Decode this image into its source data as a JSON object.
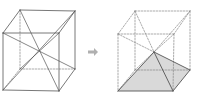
{
  "diagram": {
    "colors": {
      "edge": "#555555",
      "dashed": "#888888",
      "arrow": "#b0b0b0",
      "pyramid_fill": "#d9d9d9"
    },
    "arrow_glyph": "➡"
  }
}
